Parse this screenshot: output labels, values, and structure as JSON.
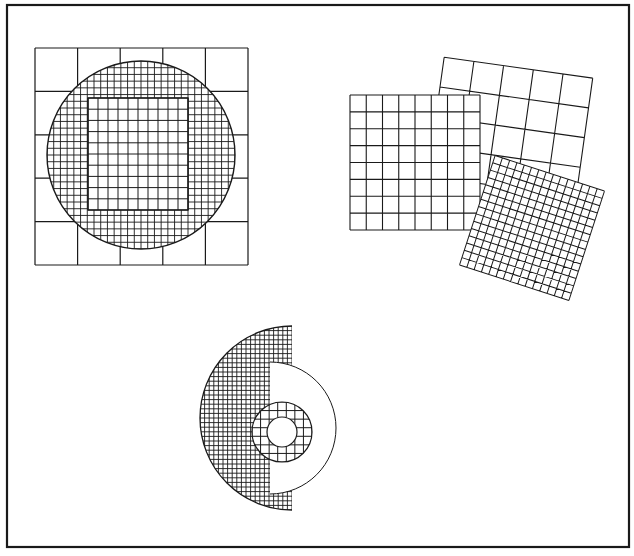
{
  "figure": {
    "title": "",
    "colors": {
      "ink": "#1a1a1a",
      "paper": "#ffffff"
    },
    "frame": {
      "x": 7,
      "y": 5,
      "w": 622,
      "h": 542
    },
    "panels": [
      {
        "name": "circle-on-square",
        "outer_square": {
          "x": 35,
          "y": 48,
          "w": 213,
          "h": 217,
          "cells": 5
        },
        "circle": {
          "cx": 141,
          "cy": 155,
          "r": 94,
          "cells_across": 28
        },
        "inner_square": {
          "x": 88,
          "y": 98,
          "w": 100,
          "h": 112,
          "cells": 10
        }
      },
      {
        "name": "overlapping-squares",
        "back_square": {
          "cx": 508,
          "cy": 142,
          "size": 150,
          "rotate": 8,
          "cells": 5
        },
        "middle_square": {
          "x": 350,
          "y": 95,
          "w": 130,
          "h": 135,
          "cells": 8
        },
        "front_square": {
          "cx": 532,
          "cy": 228,
          "size": 115,
          "rotate": 18,
          "cells": 15
        }
      },
      {
        "name": "split-disc",
        "left_half": {
          "cx": 292,
          "cy": 418,
          "r": 92,
          "cells_across": 40
        },
        "right_annulus": {
          "cx": 292,
          "cy": 428,
          "r_outer": 66
        },
        "inner_ring": {
          "cx": 282,
          "cy": 432,
          "r_outer": 30,
          "r_inner": 15,
          "cells_across": 7
        }
      }
    ]
  }
}
